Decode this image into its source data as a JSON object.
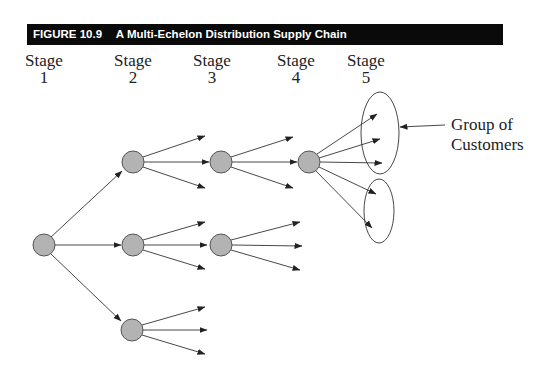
{
  "figure": {
    "number": "FIGURE 10.9",
    "title": "A Multi-Echelon Distribution Supply Chain"
  },
  "stages": [
    {
      "word": "Stage",
      "num": "1",
      "x": 14
    },
    {
      "word": "Stage",
      "num": "2",
      "x": 100
    },
    {
      "word": "Stage",
      "num": "3",
      "x": 189
    },
    {
      "word": "Stage",
      "num": "4",
      "x": 277
    },
    {
      "word": "Stage",
      "num": "5",
      "x": 336
    }
  ],
  "annotation": {
    "line1": "Group of",
    "line2": "Customers"
  },
  "colors": {
    "node_fill": "#b3b3b3",
    "node_stroke": "#555555",
    "line": "#333333",
    "header_bg": "#0a0a0a"
  },
  "diagram": {
    "nodes": [
      {
        "id": "s1",
        "stage": 1,
        "cx": 44,
        "cy": 245
      },
      {
        "id": "s2a",
        "stage": 2,
        "cx": 133,
        "cy": 162
      },
      {
        "id": "s2b",
        "stage": 2,
        "cx": 133,
        "cy": 245
      },
      {
        "id": "s2c",
        "stage": 2,
        "cx": 132,
        "cy": 330
      },
      {
        "id": "s3a",
        "stage": 3,
        "cx": 221,
        "cy": 162
      },
      {
        "id": "s3b",
        "stage": 3,
        "cx": 221,
        "cy": 245
      },
      {
        "id": "s4a",
        "stage": 4,
        "cx": 309,
        "cy": 162
      }
    ],
    "customer_groups": [
      {
        "cx": 380,
        "cy": 133,
        "rx": 19,
        "ry": 41
      },
      {
        "cx": 379,
        "cy": 211,
        "rx": 15,
        "ry": 32
      }
    ]
  }
}
